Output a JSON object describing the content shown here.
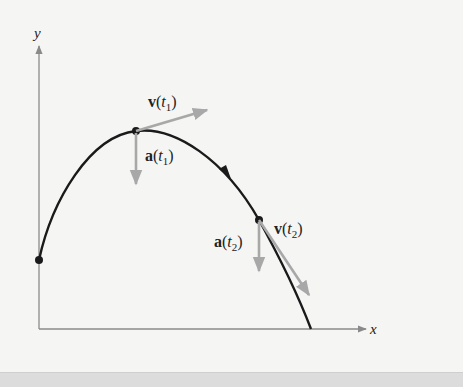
{
  "diagram": {
    "axes": {
      "x_label": "x",
      "y_label": "y",
      "color": "#8a8a8a"
    },
    "curve": {
      "color": "#1a1a1a",
      "start_point": [
        39,
        260
      ],
      "peak_point": [
        136,
        131
      ],
      "point_t2": [
        259,
        220
      ],
      "end_point": [
        311,
        329
      ]
    },
    "vectors": [
      {
        "id": "v_t1",
        "label_main": "v",
        "label_sub": "1",
        "kind": "velocity",
        "from": [
          136,
          131
        ],
        "to": [
          207,
          110
        ]
      },
      {
        "id": "a_t1",
        "label_main": "a",
        "label_sub": "1",
        "kind": "acceleration",
        "from": [
          136,
          131
        ],
        "to": [
          136,
          184
        ]
      },
      {
        "id": "v_t2",
        "label_main": "v",
        "label_sub": "2",
        "kind": "velocity",
        "from": [
          259,
          220
        ],
        "to": [
          309,
          295
        ]
      },
      {
        "id": "a_t2",
        "label_main": "a",
        "label_sub": "2",
        "kind": "acceleration",
        "from": [
          259,
          220
        ],
        "to": [
          259,
          271
        ]
      }
    ],
    "vector_color": "#a8a8a8",
    "labels": {
      "v_t1": {
        "main": "v",
        "open": "(",
        "t": "t",
        "sub": "1",
        "close": ")"
      },
      "a_t1": {
        "main": "a",
        "open": "(",
        "t": "t",
        "sub": "1",
        "close": ")"
      },
      "v_t2": {
        "main": "v",
        "open": "(",
        "t": "t",
        "sub": "2",
        "close": ")"
      },
      "a_t2": {
        "main": "a",
        "open": "(",
        "t": "t",
        "sub": "2",
        "close": ")"
      }
    }
  }
}
